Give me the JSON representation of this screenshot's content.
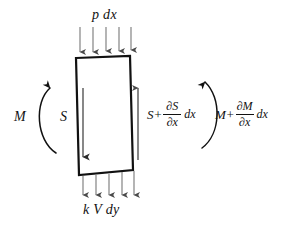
{
  "figure": {
    "background_color": "#ffffff",
    "ink_color": "#111111",
    "arrow_color": "#555555",
    "width": 292,
    "height": 225
  },
  "element": {
    "shape": "parallelogram",
    "name": "beam-element-body",
    "corners": {
      "top_left": [
        76,
        58
      ],
      "top_right": [
        130,
        56
      ],
      "bottom_right": [
        133,
        170
      ],
      "bottom_left": [
        79,
        175
      ]
    },
    "stroke_width": 2.2,
    "fill": "#ffffff"
  },
  "distributed_loads": {
    "top": {
      "label": "p dx",
      "direction": "down",
      "arrow_count": 5,
      "arrow_x": [
        80,
        93,
        106,
        119,
        131
      ],
      "arrow_y_start": 27,
      "arrow_y_end": 57
    },
    "bottom": {
      "label": "k V dy",
      "direction": "down",
      "arrow_count": 5,
      "arrow_x": [
        83,
        96,
        109,
        122,
        134
      ],
      "arrow_y_start": 175,
      "arrow_y_end": 200
    }
  },
  "forces": {
    "shear_left": {
      "label": "S",
      "direction": "down",
      "arrow_x": 83,
      "arrow_y_start": 88,
      "arrow_y_end": 163
    },
    "shear_right": {
      "base": "S+",
      "numerator": "∂S",
      "denominator": "∂x",
      "tail": "dx",
      "direction": "up",
      "arrow_x": 138,
      "arrow_y_start": 160,
      "arrow_y_end": 82
    }
  },
  "moments": {
    "left": {
      "label": "M",
      "arc_direction": "opens-right",
      "arrowhead": "top-pointing-right"
    },
    "right": {
      "base": "M+",
      "numerator": "∂M",
      "denominator": "∂x",
      "tail": "dx",
      "arc_direction": "opens-left",
      "arrowhead": "top-pointing-left"
    }
  }
}
